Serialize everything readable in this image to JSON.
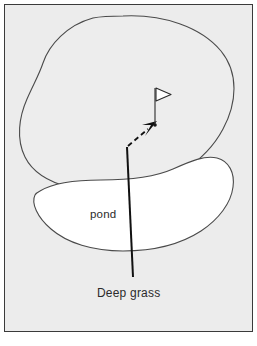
{
  "figure": {
    "kind": "golf-hole-diagram",
    "background_color": "#ececec",
    "frame_color": "#3a3a3a",
    "outline_color": "#4a4a4a",
    "ink_color": "#1a1a1a"
  },
  "labels": {
    "pond": "pond",
    "deep_grass": "Deep grass"
  },
  "areas": [
    {
      "name": "fairway-green",
      "label": "",
      "fill": "#ededed",
      "stroke": "#4a4a4a"
    },
    {
      "name": "pond",
      "label": "pond",
      "fill": "#ffffff",
      "stroke": "#4a4a4a"
    }
  ],
  "markers": {
    "flag": {
      "name": "golf-flag-pin",
      "flag_fill": "#ffffff",
      "pole_color": "#3a3a3a"
    },
    "shot_arrow": {
      "name": "dashed-shot-arrow",
      "style": "dashed",
      "color": "#111111"
    },
    "leader_line": {
      "name": "deep-grass-leader-line",
      "style": "solid",
      "color": "#111111"
    }
  },
  "caption": {
    "partial_text": ""
  }
}
